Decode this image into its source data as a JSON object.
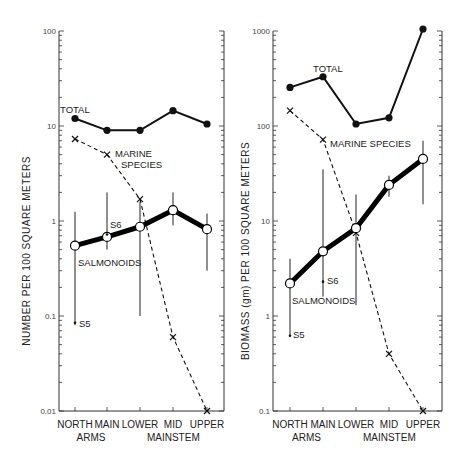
{
  "chart_data": [
    {
      "type": "line",
      "panel": "left",
      "ylabel": "NUMBER  PER  100  SQUARE  METERS",
      "xlabel": "",
      "yscale": "log",
      "ylim": [
        0.01,
        100
      ],
      "yticks": [
        0.01,
        0.1,
        1,
        10,
        100
      ],
      "ytick_labels": [
        "0.01",
        "0.1",
        "1",
        "10",
        "100"
      ],
      "categories": [
        "NORTH",
        "MAIN",
        "LOWER",
        "MID",
        "UPPER"
      ],
      "category_groups": [
        {
          "label": "ARMS",
          "spans": [
            "NORTH",
            "MAIN"
          ]
        },
        {
          "label": "MAINSTEM",
          "spans": [
            "LOWER",
            "MID",
            "UPPER"
          ]
        }
      ],
      "series": [
        {
          "name": "TOTAL",
          "style": "solid-filled-circle",
          "values": [
            12,
            9,
            9,
            14.5,
            10.5
          ]
        },
        {
          "name": "MARINE SPECIES",
          "style": "dashed-x",
          "values": [
            7.3,
            5,
            1.7,
            0.06,
            0.01
          ]
        },
        {
          "name": "SALMONOIDS",
          "style": "thick-open-circle",
          "values": [
            0.55,
            0.68,
            0.87,
            1.3,
            0.82
          ],
          "error_low": [
            0.08,
            0.5,
            0.1,
            0.9,
            0.3
          ],
          "error_high": [
            1.25,
            2.0,
            1.6,
            2.0,
            1.2
          ]
        }
      ],
      "annotations": [
        {
          "text": "TOTAL",
          "near": "TOTAL-NORTH"
        },
        {
          "text": "MARINE",
          "near": "MARINE-MAIN"
        },
        {
          "text": "SPECIES",
          "near": "MARINE-MAIN"
        },
        {
          "text": "SALMONOIDS",
          "near": "SALMONOIDS-NORTH"
        },
        {
          "text": "S6",
          "category": "MAIN",
          "value": 0.72
        },
        {
          "text": "S5",
          "category": "NORTH",
          "value": 0.085
        }
      ]
    },
    {
      "type": "line",
      "panel": "right",
      "ylabel": "BIOMASS  (gm)  PER  100  SQUARE  METERS",
      "xlabel": "",
      "yscale": "log",
      "ylim": [
        0.1,
        1000
      ],
      "yticks": [
        0.1,
        1,
        10,
        100,
        1000
      ],
      "ytick_labels": [
        "0.1",
        "1",
        "10",
        "100",
        "1000"
      ],
      "categories": [
        "NORTH",
        "MAIN",
        "LOWER",
        "MID",
        "UPPER"
      ],
      "category_groups": [
        {
          "label": "ARMS",
          "spans": [
            "NORTH",
            "MAIN"
          ]
        },
        {
          "label": "MAINSTEM",
          "spans": [
            "LOWER",
            "MID",
            "UPPER"
          ]
        }
      ],
      "series": [
        {
          "name": "TOTAL",
          "style": "solid-filled-circle",
          "values": [
            255,
            330,
            105,
            122,
            1050
          ]
        },
        {
          "name": "MARINE SPECIES",
          "style": "dashed-x",
          "values": [
            145,
            72,
            7.5,
            0.4,
            0.1
          ]
        },
        {
          "name": "SALMONOIDS",
          "style": "thick-open-circle",
          "values": [
            2.2,
            4.8,
            8.4,
            24,
            45
          ],
          "error_low": [
            0.62,
            1.6,
            1.3,
            18,
            15
          ],
          "error_high": [
            4.0,
            35,
            19,
            30,
            70
          ]
        }
      ],
      "annotations": [
        {
          "text": "TOTAL",
          "near": "TOTAL-MAIN"
        },
        {
          "text": "MARINE  SPECIES",
          "near": "MARINE-MAIN"
        },
        {
          "text": "SALMONOIDS",
          "near": "SALMONOIDS-NORTH"
        },
        {
          "text": "S6",
          "category": "MAIN",
          "value": 2.3
        },
        {
          "text": "S5",
          "category": "NORTH",
          "value": 0.62
        }
      ]
    }
  ]
}
